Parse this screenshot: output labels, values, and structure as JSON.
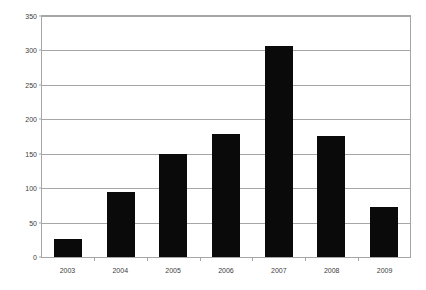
{
  "chart_data": {
    "type": "bar",
    "title": "",
    "subtitle": "",
    "xlabel": "",
    "ylabel": "",
    "categories": [
      "2003",
      "2004",
      "2005",
      "2006",
      "2007",
      "2008",
      "2009"
    ],
    "values": [
      26,
      94,
      150,
      178,
      306,
      176,
      72
    ],
    "series": [
      {
        "name": "",
        "values": [
          26,
          94,
          150,
          178,
          306,
          176,
          72
        ]
      }
    ],
    "ylim": [
      0,
      350
    ],
    "yticks": [
      0,
      50,
      100,
      150,
      200,
      250,
      300,
      350
    ],
    "ytick_labels": [
      "0",
      "50",
      "100",
      "150",
      "200",
      "250",
      "300",
      "350"
    ],
    "xtick_labels": [
      "2003",
      "2004",
      "2005",
      "2006",
      "2007",
      "2008",
      "2009"
    ],
    "grid": true,
    "grid_axis": "y",
    "legend": false,
    "legend_position": "none",
    "bar_color": "#0a0a0a",
    "grid_color": "#a6a6a6",
    "axis_color": "#a6a6a6",
    "tick_label_color": "#3d3d3d",
    "background_color": "#ffffff"
  }
}
